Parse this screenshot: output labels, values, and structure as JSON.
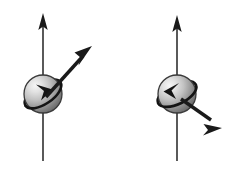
{
  "canvas": {
    "width": 244,
    "height": 170,
    "background": "#ffffff",
    "title": "Particle spin and momentum diagram"
  },
  "palette": {
    "stroke": "#1a1a1a",
    "arrow_fill": "#1a1a1a",
    "sphere_light": "#f2f2f2",
    "sphere_mid": "#b8b8b8",
    "sphere_dark": "#6e6e6e",
    "sphere_edge": "#3a3a3a",
    "ring_stroke": "#141414",
    "axis_stroke": "#3d3d3d",
    "background": "#ffffff"
  },
  "figures": [
    {
      "id": "left-particle",
      "name": "left-spin-particle",
      "label": "",
      "sphere": {
        "cx": 43,
        "cy": 94,
        "r": 19,
        "highlight_x": 33,
        "highlight_y": 85
      },
      "spin_axis": {
        "name": "vertical-spin-axis",
        "x": 43,
        "y_tip": 14,
        "y_tail": 161,
        "direction": "up",
        "arrowhead_width": 9,
        "arrowhead_length": 17
      },
      "momentum_arrow": {
        "name": "momentum-vector",
        "x1": 46,
        "y1": 97,
        "x2": 92,
        "y2": 46,
        "direction": "up-right",
        "arrowhead_width": 12,
        "arrowhead_length": 19
      },
      "spin_ring": {
        "name": "spin-rotation-ring",
        "rotation_deg": -34,
        "rx": 21,
        "ry": 10,
        "arrow_direction": "clockwise",
        "arrowhead_angle_deg": 128
      }
    },
    {
      "id": "right-particle",
      "name": "right-spin-particle",
      "label": "",
      "sphere": {
        "cx": 177,
        "cy": 94,
        "r": 19,
        "highlight_x": 167,
        "highlight_y": 85
      },
      "spin_axis": {
        "name": "vertical-spin-axis",
        "x": 177,
        "y_tip": 16,
        "y_tail": 161,
        "direction": "up",
        "arrowhead_width": 9,
        "arrowhead_length": 17
      },
      "momentum_arrow": {
        "name": "momentum-vector",
        "x1": 181,
        "y1": 99,
        "x2": 222,
        "y2": 127,
        "direction": "down-right",
        "arrowhead_width": 12,
        "arrowhead_length": 19
      },
      "spin_ring": {
        "name": "spin-rotation-ring",
        "rotation_deg": -26,
        "rx": 21,
        "ry": 10,
        "arrow_direction": "clockwise",
        "arrowhead_angle_deg": 152
      }
    }
  ]
}
